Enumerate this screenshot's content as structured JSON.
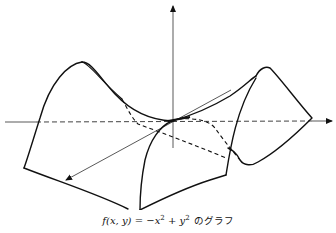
{
  "figure": {
    "axes": {
      "vertical": "z-axis",
      "horizontal": "y-axis",
      "diagonal": "x-axis"
    },
    "colors": {
      "line": "#111111",
      "background": "#ffffff"
    }
  },
  "caption": {
    "function_lhs": "f(x, y)",
    "equals": " = ",
    "term1_sign": "−x",
    "term1_exp": "2",
    "plus": " + y",
    "term2_exp": "2",
    "suffix": "のグラフ"
  }
}
